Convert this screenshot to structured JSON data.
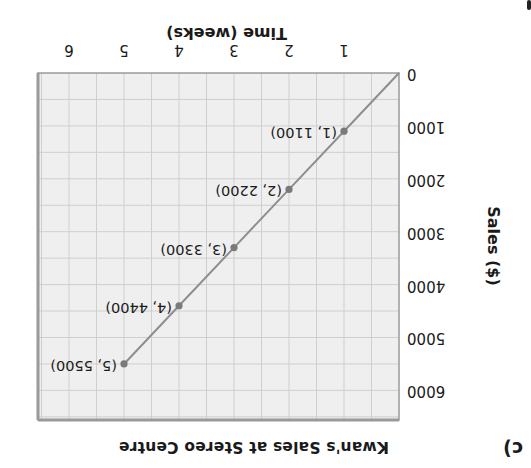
{
  "figure": {
    "part_label": "c)",
    "orientation_note_rotation_deg": 180
  },
  "chart_data": {
    "type": "line",
    "title": "Kwan's Sales at Stereo Centre",
    "xlabel": "Time (weeks)",
    "ylabel": "Sales ($)",
    "x_ticks": [
      "1",
      "2",
      "3",
      "4",
      "5",
      "6"
    ],
    "y_ticks": [
      "0",
      "1000",
      "2000",
      "3000",
      "4000",
      "5000",
      "6000"
    ],
    "xlim": [
      0,
      6.55
    ],
    "ylim": [
      0,
      6550
    ],
    "grid": true,
    "grid_minor_x_step": 0.5,
    "grid_minor_y_step": 500,
    "series": [
      {
        "name": "Sales",
        "x": [
          0,
          1,
          2,
          3,
          4,
          5
        ],
        "y": [
          0,
          1100,
          2200,
          3300,
          4400,
          5500
        ],
        "line_from_origin": true
      }
    ],
    "point_labels": [
      "(1, 1100)",
      "(2, 2200)",
      "(3, 3300)",
      "(4, 4400)",
      "(5, 5500)"
    ],
    "labeled_points": [
      {
        "x": 1,
        "y": 1100
      },
      {
        "x": 2,
        "y": 2200
      },
      {
        "x": 3,
        "y": 3300
      },
      {
        "x": 4,
        "y": 4400
      },
      {
        "x": 5,
        "y": 5500
      }
    ]
  },
  "colors": {
    "plot_background": "#efefef",
    "grid_line": "#cfcfcf",
    "plot_border": "#9a9a9a",
    "data_line": "#8e8e8e",
    "data_point": "#7a7a7a",
    "text": "#1a1a1a"
  }
}
